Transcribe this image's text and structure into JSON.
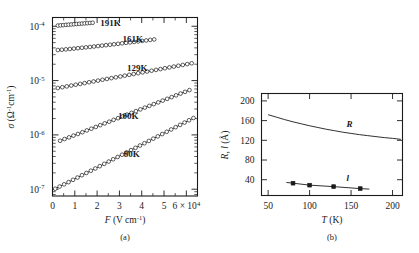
{
  "figure": {
    "panel_a_caption": "(a)",
    "panel_b_caption": "(b)"
  },
  "chart_data": [
    {
      "type": "line",
      "id": "panel-a",
      "title": "",
      "xlabel": "F (V cm⁻¹)",
      "ylabel": "σ (Ω⁻¹cm⁻¹)",
      "xscale": "linear",
      "yscale": "log",
      "xlim": [
        0,
        65000
      ],
      "ylim": [
        7.5e-08,
        0.000145
      ],
      "grid": false,
      "legend": "inline-annotations",
      "xticks": [
        0,
        10000,
        20000,
        30000,
        40000,
        50000,
        60000
      ],
      "xticklabels": [
        "0",
        "1",
        "2",
        "3",
        "4",
        "5",
        "6 × 10⁴"
      ],
      "yticks": [
        0.0001,
        1e-05,
        1e-06,
        1e-07
      ],
      "yticklabels": [
        "10⁻⁴",
        "10⁻⁵",
        "10⁻⁶",
        "10⁻⁷"
      ],
      "marker": "open-circle",
      "series": [
        {
          "name": "191K",
          "label": "191K",
          "label_x": 26000,
          "label_y": 0.000102,
          "x": [
            2400,
            3600,
            4800,
            6000,
            7200,
            8400,
            9600,
            10800,
            12000,
            13200,
            14400,
            15600,
            16800,
            18000
          ],
          "y": [
            0.000103,
            0.000104,
            0.000105,
            0.000106,
            0.000107,
            0.000108,
            0.000109,
            0.00011,
            0.000111,
            0.000112,
            0.000113,
            0.000114,
            0.000115,
            0.000116
          ]
        },
        {
          "name": "161K",
          "label": "161K",
          "label_x": 36000,
          "label_y": 5.1e-05,
          "x": [
            2400,
            4200,
            6000,
            7800,
            9600,
            11400,
            13200,
            15000,
            16800,
            18600,
            20400,
            22200,
            24000,
            25800,
            27600,
            29400,
            31200,
            33000,
            34800,
            36600,
            38400,
            40200,
            42000,
            43800,
            45600
          ],
          "y": [
            3.65e-05,
            3.7e-05,
            3.76e-05,
            3.82e-05,
            3.88e-05,
            3.95e-05,
            4.02e-05,
            4.09e-05,
            4.16e-05,
            4.24e-05,
            4.32e-05,
            4.4e-05,
            4.48e-05,
            4.57e-05,
            4.66e-05,
            4.75e-05,
            4.85e-05,
            4.95e-05,
            5.05e-05,
            5.15e-05,
            5.26e-05,
            5.37e-05,
            5.48e-05,
            5.6e-05,
            5.72e-05
          ]
        },
        {
          "name": "129K",
          "label": "129K",
          "label_x": 38000,
          "label_y": 1.52e-05,
          "x": [
            2400,
            4400,
            6400,
            8400,
            10400,
            12400,
            14400,
            16400,
            18400,
            20400,
            22400,
            24400,
            26400,
            28400,
            30400,
            32400,
            34400,
            36400,
            38400,
            40400,
            42400,
            44400,
            46400,
            48400,
            50400,
            52400,
            54400,
            56400,
            58400,
            60400,
            62400
          ],
          "y": [
            7.3e-06,
            7.55e-06,
            7.82e-06,
            8.1e-06,
            8.38e-06,
            8.68e-06,
            8.99e-06,
            9.31e-06,
            9.64e-06,
            9.98e-06,
            1.034e-05,
            1.071e-05,
            1.109e-05,
            1.149e-05,
            1.19e-05,
            1.232e-05,
            1.276e-05,
            1.321e-05,
            1.368e-05,
            1.417e-05,
            1.467e-05,
            1.519e-05,
            1.573e-05,
            1.629e-05,
            1.687e-05,
            1.747e-05,
            1.809e-05,
            1.874e-05,
            1.94e-05,
            2.009e-05,
            2.081e-05
          ]
        },
        {
          "name": "100K",
          "label": "100K",
          "label_x": 34000,
          "label_y": 1.95e-06,
          "x": [
            3400,
            5400,
            7400,
            9400,
            11400,
            13400,
            15400,
            17400,
            19400,
            21400,
            23400,
            25400,
            27400,
            29400,
            31400,
            33400,
            35400,
            37400,
            39400,
            41400,
            43400,
            45400,
            47400,
            49400,
            51400,
            53400,
            55400,
            57400,
            59400,
            61400
          ],
          "y": [
            7.8e-07,
            8.4e-07,
            9e-07,
            9.7e-07,
            1.04e-06,
            1.12e-06,
            1.21e-06,
            1.3e-06,
            1.4e-06,
            1.51e-06,
            1.63e-06,
            1.75e-06,
            1.89e-06,
            2.03e-06,
            2.19e-06,
            2.36e-06,
            2.54e-06,
            2.74e-06,
            2.95e-06,
            3.18e-06,
            3.42e-06,
            3.69e-06,
            3.97e-06,
            4.28e-06,
            4.61e-06,
            4.96e-06,
            5.35e-06,
            5.76e-06,
            6.2e-06,
            6.68e-06
          ]
        },
        {
          "name": "80K",
          "label": "80K",
          "label_x": 35500,
          "label_y": 4e-07,
          "x": [
            1200,
            3200,
            5200,
            7200,
            9200,
            11200,
            13200,
            15200,
            17200,
            19200,
            21200,
            23200,
            25200,
            27200,
            29200,
            31200,
            33200,
            35200,
            37200,
            39200,
            41200,
            43200,
            45200,
            47200,
            49200,
            51200,
            53200,
            55200,
            57200,
            59200,
            61200,
            63200
          ],
          "y": [
            1.02e-07,
            1.12e-07,
            1.23e-07,
            1.35e-07,
            1.49e-07,
            1.64e-07,
            1.81e-07,
            1.99e-07,
            2.19e-07,
            2.41e-07,
            2.66e-07,
            2.93e-07,
            3.23e-07,
            3.56e-07,
            3.92e-07,
            4.32e-07,
            4.76e-07,
            5.25e-07,
            5.78e-07,
            6.37e-07,
            7.02e-07,
            7.74e-07,
            8.53e-07,
            9.4e-07,
            1.036e-06,
            1.142e-06,
            1.259e-06,
            1.388e-06,
            1.53e-06,
            1.686e-06,
            1.859e-06,
            2.049e-06
          ]
        }
      ]
    },
    {
      "type": "line",
      "id": "panel-b",
      "title": "",
      "xlabel": "T (K)",
      "ylabel": "R, l (Å)",
      "xscale": "linear",
      "yscale": "linear",
      "xlim": [
        42,
        212
      ],
      "ylim": [
        8,
        215
      ],
      "grid": false,
      "legend": "inline-annotations",
      "xticks": [
        50,
        100,
        150,
        200
      ],
      "xticklabels": [
        "50",
        "100",
        "150",
        "200"
      ],
      "yticks": [
        40,
        80,
        120,
        160,
        200
      ],
      "yticklabels": [
        "40",
        "80",
        "120",
        "160",
        "200"
      ],
      "series": [
        {
          "name": "R",
          "label": "R",
          "label_x": 148,
          "label_y": 147,
          "marker": "none",
          "x": [
            50,
            60,
            70,
            80,
            90,
            100,
            110,
            120,
            130,
            140,
            150,
            160,
            170,
            180,
            190,
            200,
            210
          ],
          "y": [
            172,
            167,
            162,
            157.5,
            153.5,
            149.5,
            146,
            142.5,
            139.5,
            136.5,
            134,
            131.5,
            129.5,
            127.5,
            125.5,
            124,
            122
          ]
        },
        {
          "name": "l",
          "label": "l",
          "label_x": 146,
          "label_y": 37,
          "marker": "filled-square",
          "x": [
            80,
            100,
            129,
            161
          ],
          "y": [
            33,
            29,
            26,
            22
          ],
          "line_x": [
            72,
            80,
            100,
            129,
            161,
            172
          ],
          "line_y": [
            34.5,
            33,
            29,
            26,
            22,
            21
          ]
        }
      ]
    }
  ]
}
